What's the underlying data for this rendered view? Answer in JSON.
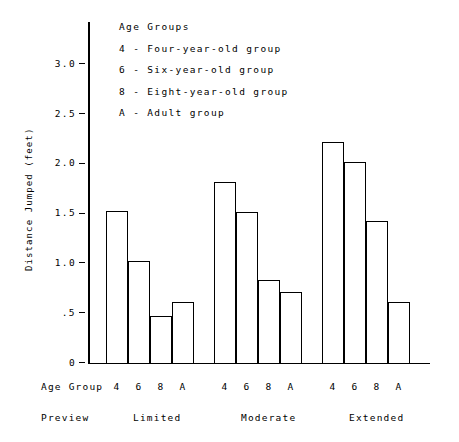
{
  "chart_data": {
    "type": "bar",
    "title": "",
    "xlabel": "Age Group",
    "ylabel": "Distance Jumped (feet)",
    "ylim": [
      0,
      3.35
    ],
    "grid": false,
    "legend_position": "top-inside-right",
    "categories": [
      "Limited",
      "Moderate",
      "Extended"
    ],
    "subcategories": [
      "4",
      "6",
      "8",
      "A"
    ],
    "yticks": [
      {
        "value": 0,
        "label": "0"
      },
      {
        "value": 0.5,
        "label": ".5"
      },
      {
        "value": 1.0,
        "label": "1.0"
      },
      {
        "value": 1.5,
        "label": "1.5"
      },
      {
        "value": 2.0,
        "label": "2.0"
      },
      {
        "value": 2.5,
        "label": "2.5"
      },
      {
        "value": 3.0,
        "label": "3.0"
      }
    ],
    "series": [
      {
        "name": "4",
        "values": [
          1.53,
          1.82,
          2.22
        ]
      },
      {
        "name": "6",
        "values": [
          1.03,
          1.52,
          2.02
        ]
      },
      {
        "name": "8",
        "values": [
          0.48,
          0.84,
          1.43
        ]
      },
      {
        "name": "A",
        "values": [
          0.62,
          0.72,
          0.62
        ]
      }
    ],
    "groups": [
      {
        "condition": "Limited",
        "bars": [
          {
            "age_group": "4",
            "value": 1.53
          },
          {
            "age_group": "6",
            "value": 1.03
          },
          {
            "age_group": "8",
            "value": 0.48
          },
          {
            "age_group": "A",
            "value": 0.62
          }
        ]
      },
      {
        "condition": "Moderate",
        "bars": [
          {
            "age_group": "4",
            "value": 1.82
          },
          {
            "age_group": "6",
            "value": 1.52
          },
          {
            "age_group": "8",
            "value": 0.84
          },
          {
            "age_group": "A",
            "value": 0.72
          }
        ]
      },
      {
        "condition": "Extended",
        "bars": [
          {
            "age_group": "4",
            "value": 2.22
          },
          {
            "age_group": "6",
            "value": 2.02
          },
          {
            "age_group": "8",
            "value": 1.43
          },
          {
            "age_group": "A",
            "value": 0.62
          }
        ]
      }
    ]
  },
  "legend": {
    "title": "Age Groups",
    "entries": [
      "4 - Four-year-old group",
      "6 - Six-year-old group",
      "8 - Eight-year-old group",
      "A - Adult group"
    ]
  },
  "axis_rows": {
    "age_group_label": "Age Group",
    "preview_label": "Preview"
  },
  "colors": {
    "background": "#ffffff",
    "ink": "#000000",
    "bar_fill": "#ffffff",
    "bar_stroke": "#000000"
  }
}
